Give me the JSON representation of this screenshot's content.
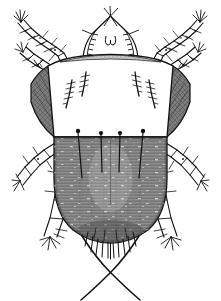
{
  "figure": {
    "view": "dorsal",
    "style": "engraved line drawing",
    "background_color": "#ffffff",
    "ink_color": "#111111",
    "body_fill_color": "#8d8d8d",
    "shoulder_fill_color": "#6f6f6f",
    "propodosoma_fill_color": "#ffffff",
    "canvas": {
      "width": 221,
      "height": 301
    },
    "caption": ""
  },
  "anatomy": {
    "gnathosoma": {
      "label": "gnathosoma",
      "outline_color": "#111111",
      "center_x": 110.5,
      "apex_y": 16,
      "base_y": 60,
      "half_width": 26,
      "hypostome_hooks": 2
    },
    "propodosoma": {
      "label": "propodosomal shield",
      "fill": "#ffffff",
      "top_y": 58,
      "bottom_y": 136,
      "left_x": 36,
      "right_x": 185,
      "setae_count": 4
    },
    "hysterosoma": {
      "label": "hysterosoma",
      "fill": "#8d8d8d",
      "top_y": 136,
      "bottom_y": 240,
      "left_x": 54,
      "right_x": 167,
      "marginal_setae_count": 4,
      "posterior_fringe_count": 11,
      "texture": "dense transverse hatching"
    },
    "shoulders": {
      "label": "humeral lobes",
      "fill": "#6f6f6f",
      "left_x": 30,
      "right_x": 191
    },
    "caudal_setae": {
      "label": "crossed caudal setae",
      "count": 2,
      "crossing_point_x": 110,
      "crossing_point_y": 272
    }
  },
  "legs": [
    {
      "id": "leg-I-left",
      "side": "left",
      "position": "anterior",
      "segments": 5,
      "label": "leg I left"
    },
    {
      "id": "leg-II-left",
      "side": "left",
      "position": "anterior",
      "segments": 5,
      "label": "leg II left"
    },
    {
      "id": "leg-III-left",
      "side": "left",
      "position": "posterior",
      "segments": 5,
      "label": "leg III left"
    },
    {
      "id": "leg-IV-left",
      "side": "left",
      "position": "posterior",
      "segments": 5,
      "label": "leg IV left"
    },
    {
      "id": "leg-I-right",
      "side": "right",
      "position": "anterior",
      "segments": 5,
      "label": "leg I right"
    },
    {
      "id": "leg-II-right",
      "side": "right",
      "position": "anterior",
      "segments": 5,
      "label": "leg II right"
    },
    {
      "id": "leg-III-right",
      "side": "right",
      "position": "posterior",
      "segments": 5,
      "label": "leg III right"
    },
    {
      "id": "leg-IV-right",
      "side": "right",
      "position": "posterior",
      "segments": 5,
      "label": "leg IV right"
    }
  ]
}
